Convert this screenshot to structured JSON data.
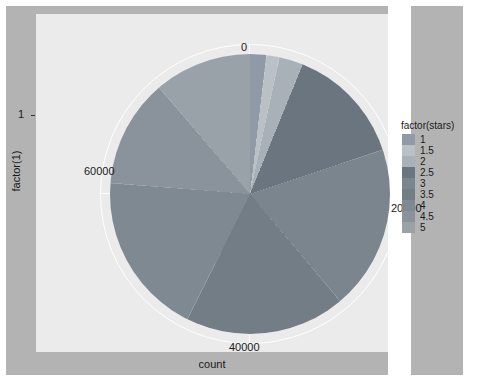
{
  "chart_data": {
    "type": "pie",
    "title": "",
    "xlabel": "count",
    "ylabel": "factor(1)",
    "legend_title": "factor(stars)",
    "legend_position": "right",
    "grid": true,
    "coord": "polar",
    "radial_axis": {
      "ticks": [
        "0",
        "20000",
        "40000",
        "60000"
      ],
      "tick_values": [
        0,
        20000,
        40000,
        60000
      ],
      "range": [
        0,
        80000
      ],
      "total": 80000
    },
    "y_axis": {
      "ticks": [
        "1"
      ]
    },
    "categories": [
      "1",
      "1.5",
      "2",
      "2.5",
      "3",
      "3.5",
      "4",
      "4.5",
      "5"
    ],
    "values": [
      1500,
      1200,
      2200,
      11000,
      15200,
      14800,
      15100,
      10000,
      8900
    ],
    "colors": [
      "#8f9aa6",
      "#b9c0c6",
      "#a9b1b8",
      "#6b757f",
      "#7b858e",
      "#737d86",
      "#7f8992",
      "#8a939b",
      "#99a2a9"
    ]
  },
  "panel": {
    "background": "#ebebeb",
    "canvas_background": "#b3b3b3",
    "grid_color": "#ffffff"
  },
  "axes": {
    "x_title": "count",
    "y_title": "factor(1)",
    "y_tick": "1",
    "radial_tick_top": "0",
    "radial_tick_right": "20000",
    "radial_tick_bottom": "40000",
    "radial_tick_left": "60000"
  },
  "legend": {
    "title": "factor(stars)",
    "items": [
      {
        "label": "1",
        "color": "#8f9aa6"
      },
      {
        "label": "1.5",
        "color": "#b9c0c6"
      },
      {
        "label": "2",
        "color": "#a9b1b8"
      },
      {
        "label": "2.5",
        "color": "#6b757f"
      },
      {
        "label": "3",
        "color": "#7b858e"
      },
      {
        "label": "3.5",
        "color": "#737d86"
      },
      {
        "label": "4",
        "color": "#7f8992"
      },
      {
        "label": "4.5",
        "color": "#8a939b"
      },
      {
        "label": "5",
        "color": "#99a2a9"
      }
    ]
  }
}
